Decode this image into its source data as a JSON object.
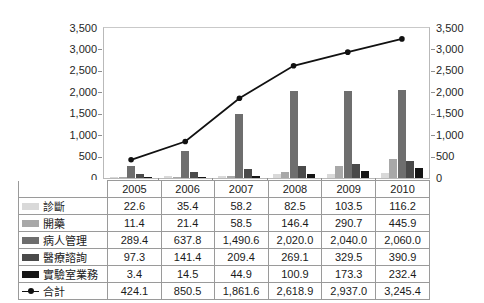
{
  "chart_data": {
    "type": "bar",
    "title": "",
    "xlabel": "",
    "ylabel": "",
    "categories": [
      "2005",
      "2006",
      "2007",
      "2008",
      "2009",
      "2010"
    ],
    "ylim": [
      0,
      3500
    ],
    "y_ticks": [
      "0",
      "500",
      "1,000",
      "1,500",
      "2,000",
      "2,500",
      "3,000",
      "3,500"
    ],
    "y_tick_values": [
      0,
      500,
      1000,
      1500,
      2000,
      2500,
      3000,
      3500
    ],
    "secondary_axis": {
      "position": "right",
      "ylim": [
        0,
        3500
      ],
      "ticks": [
        "0",
        "500",
        "1,000",
        "1,500",
        "2,000",
        "2,500",
        "3,000",
        "3,500"
      ]
    },
    "grid": false,
    "legend_position": "table-left-column",
    "series": [
      {
        "name": "診斷",
        "type": "bar",
        "color": "#d9d9d9",
        "values": [
          22.6,
          35.4,
          58.2,
          82.5,
          103.5,
          116.2
        ],
        "labels": [
          "22.6",
          "35.4",
          "58.2",
          "82.5",
          "103.5",
          "116.2"
        ]
      },
      {
        "name": "開藥",
        "type": "bar",
        "color": "#a8a8a8",
        "values": [
          11.4,
          21.4,
          58.5,
          146.4,
          290.7,
          445.9
        ],
        "labels": [
          "11.4",
          "21.4",
          "58.5",
          "146.4",
          "290.7",
          "445.9"
        ]
      },
      {
        "name": "病人管理",
        "type": "bar",
        "color": "#6e6e6e",
        "values": [
          289.4,
          637.8,
          1490.6,
          2020.0,
          2040.0,
          2060.0
        ],
        "labels": [
          "289.4",
          "637.8",
          "1,490.6",
          "2,020.0",
          "2,040.0",
          "2,060.0"
        ]
      },
      {
        "name": "醫療諮詢",
        "type": "bar",
        "color": "#4a4a4a",
        "values": [
          97.3,
          141.4,
          209.4,
          269.1,
          329.5,
          390.9
        ],
        "labels": [
          "97.3",
          "141.4",
          "209.4",
          "269.1",
          "329.5",
          "390.9"
        ]
      },
      {
        "name": "實驗室業務",
        "type": "bar",
        "color": "#151515",
        "values": [
          3.4,
          14.5,
          44.9,
          100.9,
          173.3,
          232.4
        ],
        "labels": [
          "3.4",
          "14.5",
          "44.9",
          "100.9",
          "173.3",
          "232.4"
        ]
      },
      {
        "name": "合計",
        "type": "line",
        "color": "#111111",
        "marker": "circle",
        "values": [
          424.1,
          850.5,
          1861.6,
          2618.9,
          2937.0,
          3245.4
        ],
        "labels": [
          "424.1",
          "850.5",
          "1,861.6",
          "2,618.9",
          "2,937.0",
          "3,245.4"
        ]
      }
    ]
  },
  "table": {
    "corner_label": "",
    "header": [
      "2005",
      "2006",
      "2007",
      "2008",
      "2009",
      "2010"
    ],
    "rows": [
      {
        "label": "診斷",
        "swatch": "#d9d9d9",
        "marker": "swatch",
        "values": [
          "22.6",
          "35.4",
          "58.2",
          "82.5",
          "103.5",
          "116.2"
        ]
      },
      {
        "label": "開藥",
        "swatch": "#a8a8a8",
        "marker": "swatch",
        "values": [
          "11.4",
          "21.4",
          "58.5",
          "146.4",
          "290.7",
          "445.9"
        ]
      },
      {
        "label": "病人管理",
        "swatch": "#6e6e6e",
        "marker": "swatch",
        "values": [
          "289.4",
          "637.8",
          "1,490.6",
          "2,020.0",
          "2,040.0",
          "2,060.0"
        ]
      },
      {
        "label": "醫療諮詢",
        "swatch": "#4a4a4a",
        "marker": "swatch",
        "values": [
          "97.3",
          "141.4",
          "209.4",
          "269.1",
          "329.5",
          "390.9"
        ]
      },
      {
        "label": "實驗室業務",
        "swatch": "#151515",
        "marker": "swatch",
        "values": [
          "3.4",
          "14.5",
          "44.9",
          "100.9",
          "173.3",
          "232.4"
        ]
      },
      {
        "label": "合計",
        "swatch": "#111111",
        "marker": "line",
        "values": [
          "424.1",
          "850.5",
          "1,861.6",
          "2,618.9",
          "2,937.0",
          "3,245.4"
        ]
      }
    ]
  },
  "colors": {
    "plot_border": "#b9b9b9",
    "table_border": "#9a9a9a",
    "axis_text": "#1f1f1f",
    "background": "#ffffff"
  }
}
